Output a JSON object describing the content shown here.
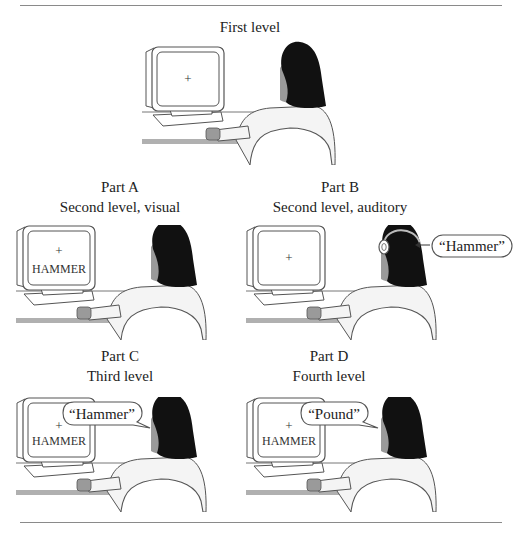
{
  "figure": {
    "panels": [
      {
        "id": "first",
        "title": "First level",
        "subtitle": "",
        "screen_cross": "+",
        "screen_word": "",
        "speech": "",
        "audio": ""
      },
      {
        "id": "part-a",
        "title": "Part A",
        "subtitle": "Second level, visual",
        "screen_cross": "+",
        "screen_word": "HAMMER",
        "speech": "",
        "audio": ""
      },
      {
        "id": "part-b",
        "title": "Part B",
        "subtitle": "Second level, auditory",
        "screen_cross": "+",
        "screen_word": "",
        "speech": "",
        "audio": "“Hammer”"
      },
      {
        "id": "part-c",
        "title": "Part C",
        "subtitle": "Third level",
        "screen_cross": "+",
        "screen_word": "HAMMER",
        "speech": "“Hammer”",
        "audio": ""
      },
      {
        "id": "part-d",
        "title": "Part D",
        "subtitle": "Fourth level",
        "screen_cross": "+",
        "screen_word": "HAMMER",
        "speech": "“Pound”",
        "audio": ""
      }
    ]
  },
  "colors": {
    "line": "#555555",
    "hair": "#111111",
    "skin": "#9a9a9a",
    "shirt": "#f4f4f4",
    "desk": "#b0b0b0",
    "rule": "#8a8a8a"
  }
}
